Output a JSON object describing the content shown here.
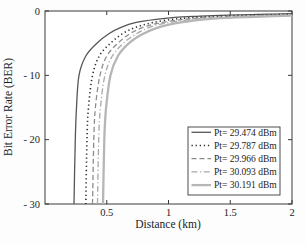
{
  "figure": {
    "background": "#fdfdfd",
    "axis_color": "#3a3a3a",
    "text_color": "#1c1c1c"
  },
  "chart_data": {
    "type": "line",
    "title": "",
    "xlabel": "Distance (km)",
    "ylabel": "Bit Error Rate (BER)",
    "xlim": [
      0,
      2
    ],
    "ylim": [
      -30,
      0
    ],
    "grid": false,
    "legend_position": "lower right",
    "xticks": {
      "values": [
        0.5,
        1,
        1.5,
        2
      ],
      "labels": [
        "0.5",
        "1",
        "1.5",
        "2"
      ]
    },
    "yticks": {
      "values": [
        0,
        -10,
        -20,
        -30
      ],
      "labels": [
        "0",
        "- 10",
        "- 20",
        "- 30"
      ]
    },
    "series": [
      {
        "name": "Pt= 29.474 dBm",
        "style": "solid",
        "color": "#565656",
        "width": 1.3,
        "points": [
          [
            0.235,
            -30
          ],
          [
            0.245,
            -20
          ],
          [
            0.255,
            -15
          ],
          [
            0.275,
            -10
          ],
          [
            0.33,
            -7
          ],
          [
            0.42,
            -5
          ],
          [
            0.52,
            -3.5
          ],
          [
            0.62,
            -2.5
          ],
          [
            0.73,
            -1.8
          ],
          [
            0.9,
            -1.3
          ],
          [
            1.05,
            -1.0
          ],
          [
            1.25,
            -0.8
          ],
          [
            1.55,
            -0.6
          ],
          [
            1.8,
            -0.5
          ],
          [
            2.0,
            -0.42
          ]
        ]
      },
      {
        "name": "Pt= 29.787 dBm",
        "style": "dotted",
        "color": "#303030",
        "width": 1.6,
        "points": [
          [
            0.33,
            -30
          ],
          [
            0.34,
            -20
          ],
          [
            0.352,
            -15
          ],
          [
            0.385,
            -10
          ],
          [
            0.44,
            -7
          ],
          [
            0.53,
            -5
          ],
          [
            0.63,
            -3.5
          ],
          [
            0.74,
            -2.5
          ],
          [
            0.87,
            -1.8
          ],
          [
            1.03,
            -1.3
          ],
          [
            1.18,
            -1.05
          ],
          [
            1.38,
            -0.85
          ],
          [
            1.68,
            -0.65
          ],
          [
            1.92,
            -0.55
          ],
          [
            2.0,
            -0.5
          ]
        ]
      },
      {
        "name": "Pt= 29.966 dBm",
        "style": "dashed",
        "color": "#8c8c8c",
        "width": 1.3,
        "points": [
          [
            0.385,
            -30
          ],
          [
            0.395,
            -20
          ],
          [
            0.408,
            -15
          ],
          [
            0.445,
            -10
          ],
          [
            0.5,
            -7
          ],
          [
            0.59,
            -5
          ],
          [
            0.69,
            -3.5
          ],
          [
            0.8,
            -2.5
          ],
          [
            0.93,
            -1.85
          ],
          [
            1.1,
            -1.35
          ],
          [
            1.25,
            -1.1
          ],
          [
            1.45,
            -0.9
          ],
          [
            1.75,
            -0.7
          ],
          [
            1.97,
            -0.6
          ],
          [
            2.0,
            -0.58
          ]
        ]
      },
      {
        "name": "Pt= 30.093 dBm",
        "style": "dashdot",
        "color": "#a8a8a8",
        "width": 1.3,
        "points": [
          [
            0.425,
            -30
          ],
          [
            0.435,
            -20
          ],
          [
            0.449,
            -15
          ],
          [
            0.485,
            -10
          ],
          [
            0.545,
            -7
          ],
          [
            0.635,
            -5
          ],
          [
            0.735,
            -3.6
          ],
          [
            0.84,
            -2.6
          ],
          [
            0.97,
            -1.9
          ],
          [
            1.15,
            -1.4
          ],
          [
            1.3,
            -1.15
          ],
          [
            1.5,
            -0.95
          ],
          [
            1.8,
            -0.75
          ],
          [
            2.0,
            -0.65
          ]
        ]
      },
      {
        "name": "Pt= 30.191 dBm",
        "style": "solid",
        "color": "#b6b6b6",
        "width": 2.3,
        "points": [
          [
            0.47,
            -30
          ],
          [
            0.48,
            -20
          ],
          [
            0.495,
            -15
          ],
          [
            0.53,
            -10
          ],
          [
            0.59,
            -7
          ],
          [
            0.68,
            -5
          ],
          [
            0.78,
            -3.7
          ],
          [
            0.895,
            -2.7
          ],
          [
            1.03,
            -2.0
          ],
          [
            1.2,
            -1.5
          ],
          [
            1.36,
            -1.2
          ],
          [
            1.56,
            -1.0
          ],
          [
            1.86,
            -0.8
          ],
          [
            2.0,
            -0.72
          ]
        ]
      }
    ]
  }
}
